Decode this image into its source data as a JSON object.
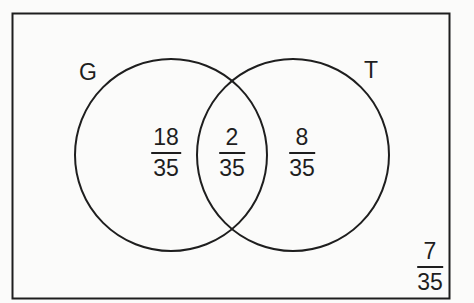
{
  "diagram": {
    "type": "venn",
    "sets": [
      {
        "name": "G",
        "label": "G"
      },
      {
        "name": "T",
        "label": "T"
      }
    ],
    "regions": {
      "g_only": {
        "numerator": "18",
        "denominator": "35"
      },
      "g_and_t": {
        "numerator": "2",
        "denominator": "35"
      },
      "t_only": {
        "numerator": "8",
        "denominator": "35"
      },
      "neither": {
        "numerator": "7",
        "denominator": "35"
      }
    },
    "colors": {
      "stroke": "#1e1e1e",
      "background": "#fbfbfa"
    }
  }
}
